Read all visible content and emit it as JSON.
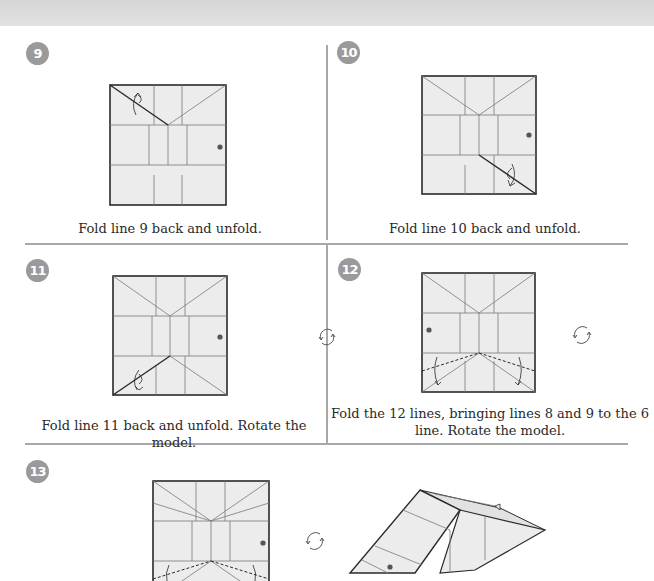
{
  "page": {
    "header_band": "",
    "colors": {
      "badge": "#9a9a9a",
      "divider": "#a9a9a9",
      "paper": "#ececec",
      "line": "#2a2a2a",
      "crease": "#7a7a7a"
    }
  },
  "steps": [
    {
      "number": "9",
      "caption": "Fold line 9 back and unfold."
    },
    {
      "number": "10",
      "caption": "Fold line 10 back and unfold."
    },
    {
      "number": "11",
      "caption": "Fold line 11 back and unfold. Rotate the model."
    },
    {
      "number": "12",
      "caption_line1": "Fold the 12 lines, bringing lines 8 and 9 to the 6",
      "caption_line2": "line. Rotate the model."
    },
    {
      "number": "13",
      "caption": ""
    }
  ],
  "icons": {
    "rotate": "rotate-model-icon",
    "fold_arrow": "valley-fold-arrow-icon",
    "reference_dot": "reference-dot-icon"
  }
}
